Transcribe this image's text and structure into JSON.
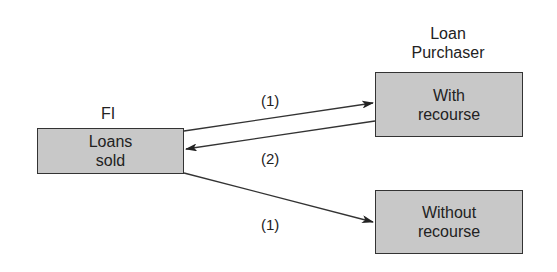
{
  "nodes": {
    "fi": {
      "title": "FI",
      "line1": "Loans",
      "line2": "sold"
    },
    "purchaser": {
      "title_line1": "Loan",
      "title_line2": "Purchaser"
    },
    "with_recourse": {
      "line1": "With",
      "line2": "recourse"
    },
    "without_recourse": {
      "line1": "Without",
      "line2": "recourse"
    }
  },
  "edges": [
    {
      "from": "Loans sold",
      "to": "With recourse",
      "label": "(1)"
    },
    {
      "from": "With recourse",
      "to": "Loans sold",
      "label": "(2)"
    },
    {
      "from": "Loans sold",
      "to": "Without recourse",
      "label": "(1)"
    }
  ],
  "colors": {
    "box_fill": "#c8c8c8",
    "stroke": "#333333"
  }
}
